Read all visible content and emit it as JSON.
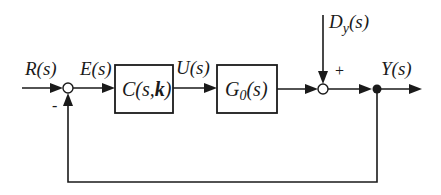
{
  "diagram": {
    "type": "feedback-control-block-diagram",
    "signals": {
      "reference": "R(s)",
      "error": "E(s)",
      "control": "U(s)",
      "disturbance_main": "D",
      "disturbance_sub": "y",
      "disturbance_suffix": "(s)",
      "output": "Y(s)"
    },
    "blocks": {
      "controller": {
        "main": "C(s,",
        "bold": "k",
        "tail": ")"
      },
      "plant": {
        "main": "G",
        "sub": "0",
        "tail": "(s)"
      }
    },
    "signs": {
      "feedback": "-",
      "disturbance": "+"
    },
    "colors": {
      "line": "#1a1a1a",
      "background": "#ffffff"
    }
  }
}
